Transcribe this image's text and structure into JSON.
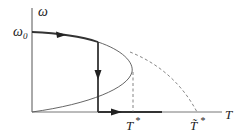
{
  "diagram": {
    "type": "bifurcation-phase-diagram",
    "axes": {
      "y_label": "ω",
      "x_label": "T"
    },
    "labels": {
      "omega0": "ω",
      "omega0_sub": "0",
      "t_star": "T",
      "t_star_sup": "*",
      "t_tilde_star": "T̃",
      "t_tilde_star_sup": "*"
    },
    "curves": [
      {
        "name": "upper-branch-thick",
        "style": "solid-bold",
        "description": "path from ω0 along upper branch with right arrow"
      },
      {
        "name": "parabolic-branch",
        "style": "solid-thin",
        "description": "fold curve turning at T* back to origin"
      },
      {
        "name": "jump-down",
        "style": "solid-bold",
        "description": "vertical drop with down arrow"
      },
      {
        "name": "axis-path",
        "style": "solid-bold",
        "description": "along T axis with right arrow"
      },
      {
        "name": "continuation",
        "style": "dashed",
        "description": "dashed curve reaching T-axis at T̃*"
      },
      {
        "name": "t-star-guide",
        "style": "dashed",
        "description": "vertical dashed line at T*"
      }
    ],
    "colors": {
      "line": "#333333",
      "thin_line": "#555555",
      "dashed": "#777777"
    }
  }
}
